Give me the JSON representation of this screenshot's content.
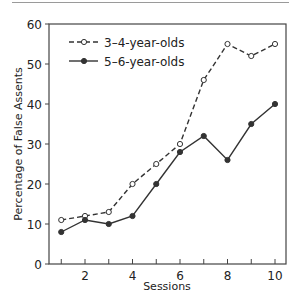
{
  "chart_data": {
    "type": "line",
    "title": "",
    "xlabel": "Sessions",
    "ylabel": "Percentage of False Assents",
    "x": [
      1,
      2,
      3,
      4,
      5,
      6,
      7,
      8,
      9,
      10
    ],
    "xticks": [
      1,
      2,
      3,
      4,
      5,
      6,
      7,
      8,
      9,
      10
    ],
    "xtick_labels": [
      "2",
      "4",
      "6",
      "8",
      "10"
    ],
    "xtick_label_values": [
      2,
      4,
      6,
      8,
      10
    ],
    "yticks": [
      0,
      10,
      20,
      30,
      40,
      50,
      60
    ],
    "ytick_labels": [
      "0",
      "10",
      "20",
      "30",
      "40",
      "50",
      "60"
    ],
    "xlim": [
      0.5,
      10.5
    ],
    "ylim": [
      0,
      60
    ],
    "grid": false,
    "legend_position": "upper left",
    "series": [
      {
        "name": "3–4-year-olds",
        "style": "dashed",
        "marker": "open-circle",
        "color": "#333333",
        "values": [
          11,
          12,
          13,
          20,
          25,
          30,
          46,
          55,
          52,
          55
        ]
      },
      {
        "name": "5–6-year-olds",
        "style": "solid",
        "marker": "filled-circle",
        "color": "#333333",
        "values": [
          8,
          11,
          10,
          12,
          20,
          28,
          32,
          26,
          35,
          40
        ]
      }
    ]
  },
  "legend": {
    "items": [
      {
        "label": "3–4-year-olds"
      },
      {
        "label": "5–6-year-olds"
      }
    ]
  },
  "axes": {
    "xlabel": "Sessions",
    "ylabel": "Percentage of False Assents"
  }
}
